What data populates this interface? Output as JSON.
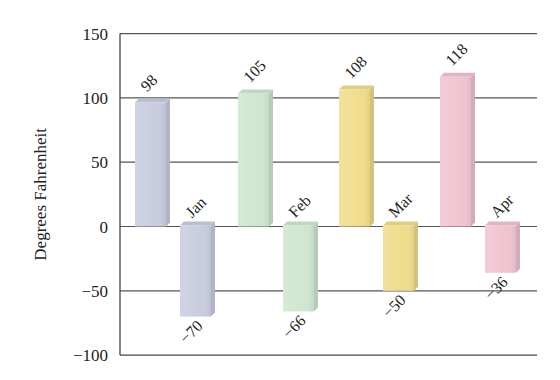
{
  "chart_data": {
    "type": "bar",
    "title": "",
    "xlabel": "",
    "ylabel": "Degrees Fahrenheit",
    "ylim": [
      -100,
      150
    ],
    "yticks": [
      150,
      100,
      50,
      0,
      -50,
      -100
    ],
    "grid": true,
    "legend": null,
    "categories": [
      "Jan",
      "Feb",
      "Mar",
      "Apr"
    ],
    "series": [
      {
        "name": "High",
        "values": [
          98,
          105,
          108,
          118
        ]
      },
      {
        "name": "Low",
        "values": [
          -70,
          -66,
          -50,
          -36
        ]
      }
    ],
    "colors": {
      "Jan": "#c9ccdf",
      "Feb": "#cfe6cf",
      "Mar": "#f0dc8c",
      "Apr": "#efc4d0"
    },
    "value_labels": {
      "High": [
        "98",
        "105",
        "108",
        "118"
      ],
      "Low": [
        "−70",
        "−66",
        "−50",
        "−36"
      ]
    },
    "tick_labels": [
      "150",
      "100",
      "50",
      "0",
      "−50",
      "−100"
    ]
  }
}
